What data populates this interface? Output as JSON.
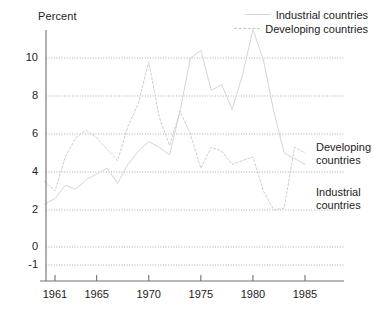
{
  "axis_title": "Percent",
  "legend": {
    "items": [
      {
        "label": "Industrial countries",
        "style": "solid",
        "swatch_name": "legend-line-solid"
      },
      {
        "label": "Developing countries",
        "style": "dashed",
        "swatch_name": "legend-line-dashed"
      }
    ]
  },
  "inline_notes": {
    "developing_line1": "Developing",
    "developing_line2": "countries",
    "industrial_line1": "Industrial",
    "industrial_line2": "countries"
  },
  "chart_data": {
    "type": "line",
    "title": "",
    "subtitle": "",
    "xlabel": "",
    "ylabel": "Percent",
    "xlim": [
      1959,
      1986
    ],
    "ylim": [
      -1,
      11
    ],
    "grid": true,
    "grid_axis": "y",
    "legend_position": "top-right",
    "ytick_labels": [
      "10",
      "8",
      "6",
      "4",
      "2",
      "0",
      "-1"
    ],
    "yticks": [
      10,
      8,
      6,
      4,
      2,
      0,
      -1
    ],
    "xtick_labels": [
      "1961",
      "1965",
      "1970",
      "1975",
      "1980",
      "1985"
    ],
    "xticks": [
      1961,
      1965,
      1970,
      1975,
      1980,
      1985
    ],
    "x": [
      1960,
      1961,
      1962,
      1963,
      1964,
      1965,
      1966,
      1967,
      1968,
      1969,
      1970,
      1971,
      1972,
      1973,
      1974,
      1975,
      1976,
      1977,
      1978,
      1979,
      1980,
      1981,
      1982,
      1983,
      1984,
      1985
    ],
    "series": [
      {
        "name": "Industrial countries",
        "style": "solid",
        "color": "#d5d5d5",
        "values": [
          2.3,
          2.6,
          3.3,
          3.1,
          3.6,
          3.9,
          4.2,
          3.4,
          4.4,
          5.1,
          5.6,
          5.3,
          4.9,
          7.2,
          10.0,
          10.4,
          8.3,
          8.6,
          7.3,
          9.1,
          11.5,
          9.9,
          7.2,
          5.0,
          4.7,
          4.4
        ]
      },
      {
        "name": "Developing countries",
        "style": "dashed",
        "color": "#cfcfcf",
        "values": [
          3.5,
          3.0,
          4.8,
          5.8,
          6.2,
          5.8,
          5.2,
          4.6,
          6.4,
          7.6,
          9.8,
          6.9,
          5.4,
          7.2,
          6.0,
          4.2,
          5.3,
          5.1,
          4.4,
          4.6,
          4.8,
          3.0,
          2.0,
          2.1,
          5.3,
          5.0
        ]
      }
    ],
    "annotations": [
      {
        "text": "Developing countries",
        "x": 1986.2,
        "y": 4.8
      },
      {
        "text": "Industrial countries",
        "x": 1986.2,
        "y": 2.7
      }
    ]
  }
}
